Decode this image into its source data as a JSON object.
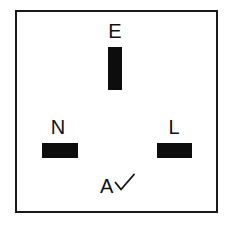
{
  "diagram": {
    "background_color": "#ffffff",
    "outline_color": "#1a1a1a",
    "slot_color": "#0d0d0d",
    "label_color": "#111111"
  },
  "terminals": [
    {
      "id": "earth",
      "label": "E",
      "name": "Earth",
      "orientation": "vertical"
    },
    {
      "id": "neutral",
      "label": "N",
      "name": "Neutral",
      "orientation": "horizontal"
    },
    {
      "id": "live",
      "label": "L",
      "name": "Live",
      "orientation": "horizontal"
    }
  ],
  "annotation": {
    "letter": "A",
    "mark": "check-mark"
  }
}
